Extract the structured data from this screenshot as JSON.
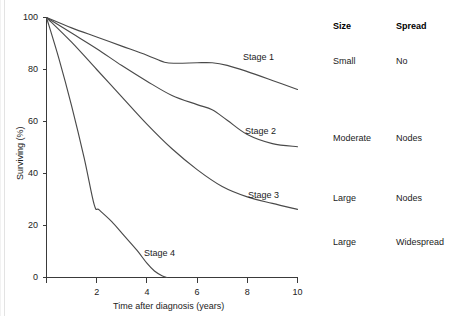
{
  "chart_data": {
    "type": "line",
    "title": "",
    "xlabel": "Time after diagnosis (years)",
    "ylabel": "Surviving (%)",
    "xlim": [
      0,
      10
    ],
    "ylim": [
      0,
      100
    ],
    "xticks": [
      0,
      2,
      4,
      6,
      8,
      10
    ],
    "xtick_labels": [
      "0",
      "2",
      "4",
      "6",
      "8",
      "10"
    ],
    "yticks": [
      0,
      20,
      40,
      60,
      80,
      100
    ],
    "ytick_labels": [
      "0",
      "20",
      "40",
      "60",
      "80",
      "100"
    ],
    "grid": false,
    "legend": "inline-annotations",
    "series": [
      {
        "name": "Stage 1",
        "x": [
          0,
          1,
          2,
          3,
          4,
          4.7,
          5.2,
          6,
          6.6,
          7.2,
          8,
          9,
          10
        ],
        "values": [
          100,
          96,
          92.5,
          89,
          85.5,
          82.8,
          82.4,
          82.6,
          82.6,
          81.6,
          79.2,
          75.8,
          72.3
        ]
      },
      {
        "name": "Stage 2",
        "x": [
          0,
          1,
          2,
          3,
          4,
          5,
          6,
          6.6,
          7.2,
          8,
          9,
          10
        ],
        "values": [
          100,
          94,
          88,
          81.5,
          75.5,
          70,
          66.5,
          64.5,
          60.5,
          55,
          51.5,
          50.3
        ]
      },
      {
        "name": "Stage 3",
        "x": [
          0,
          1,
          2,
          3,
          4,
          5,
          6,
          7,
          8,
          9,
          10
        ],
        "values": [
          100,
          90.5,
          80,
          69.5,
          59,
          49.5,
          41.5,
          35,
          31,
          28.5,
          26.2
        ]
      },
      {
        "name": "Stage 4",
        "x": [
          0,
          0.5,
          1,
          1.5,
          1.9,
          2.1,
          2.6,
          3.1,
          3.6,
          4.0,
          4.3,
          4.6,
          4.8
        ],
        "values": [
          100,
          84,
          66,
          46,
          28,
          26,
          21.5,
          16,
          10.5,
          5.5,
          2.5,
          0.7,
          0
        ]
      }
    ],
    "annotations": [
      {
        "text": "Stage 1",
        "x": 8.2,
        "y": 84
      },
      {
        "text": "Stage 2",
        "x": 8.3,
        "y": 57
      },
      {
        "text": "Stage 3",
        "x": 8.4,
        "y": 32
      },
      {
        "text": "Stage 4",
        "x": 4.3,
        "y": 10
      }
    ]
  },
  "table": {
    "headers": [
      "Size",
      "Spread"
    ],
    "rows": [
      {
        "size": "Small",
        "spread": "No"
      },
      {
        "size": "Moderate",
        "spread": "Nodes"
      },
      {
        "size": "Large",
        "spread": "Nodes"
      },
      {
        "size": "Large",
        "spread": "Widespread"
      }
    ]
  },
  "colors": {
    "curve": "#4a4a4a",
    "axis": "#3a3a3a",
    "text": "#1b1b1b",
    "background": "#ffffff"
  }
}
